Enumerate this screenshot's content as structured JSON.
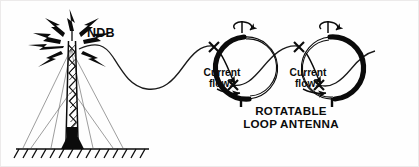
{
  "diagram": {
    "background_color": "#fefefe",
    "ink_color": "#0b0b0b"
  },
  "transmitter": {
    "name": "ndb-tower",
    "label": "NDB",
    "description": "Guyed lattice mast radiating radio energy",
    "radiation_symbol": "lightning-bolts",
    "bolt_count": 8,
    "guy_wire_count": 6,
    "ground": "hatched-ground-line"
  },
  "wave": {
    "name": "radio-wave",
    "shape": "sine",
    "direction": "left-to-right",
    "crossing_marker": "x-mark"
  },
  "antennas": [
    {
      "name": "rotatable-loop-antenna-1",
      "current_label_line1": "Current",
      "current_label_line2": "flows",
      "rotation_indicator": "curved-rotation-arrow",
      "thick_arc_side": "left",
      "mount_stub": "bottom"
    },
    {
      "name": "rotatable-loop-antenna-2",
      "current_label_line1": "Current",
      "current_label_line2": "flows",
      "rotation_indicator": "curved-rotation-arrow",
      "thick_arc_side": "right",
      "mount_stub": "bottom"
    }
  ],
  "caption": {
    "line1": "ROTATABLE",
    "line2": "LOOP ANTENNA"
  }
}
